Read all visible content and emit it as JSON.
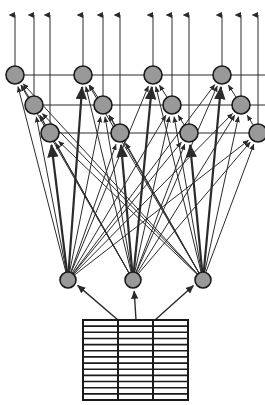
{
  "diagram": {
    "type": "neural-network-architecture",
    "canvas": {
      "width": 265,
      "height": 405
    },
    "colors": {
      "background": "#ffffff",
      "node_fill": "#999999",
      "node_stroke": "#1a1a1a",
      "edge": "#2b2b2b",
      "grid_line": "#1a1a1a",
      "grid_fill": "#ffffff"
    },
    "geometry": {
      "node_radius": 9,
      "hidden_node_radius": 8,
      "edge_width": 1,
      "thick_edge_width": 2.2,
      "grid_border_width": 2,
      "grid_row_line_width": 1.6,
      "grid_col_line_width": 2
    },
    "output_arrows": {
      "label": "output-arrows",
      "count": 12,
      "tip_y": 8,
      "x_positions": [
        15,
        34,
        50,
        83,
        103,
        120,
        153,
        172,
        189,
        222,
        241,
        258
      ]
    },
    "upper_layer": {
      "label": "upper-node-layer",
      "cluster_count": 4,
      "nodes_per_cluster": 3,
      "row_y": [
        75,
        105,
        133
      ],
      "clusters": [
        {
          "name": "cluster-1",
          "x": [
            15,
            34,
            50
          ]
        },
        {
          "name": "cluster-2",
          "x": [
            83,
            103,
            120
          ]
        },
        {
          "name": "cluster-3",
          "x": [
            153,
            172,
            189
          ]
        },
        {
          "name": "cluster-4",
          "x": [
            222,
            241,
            258
          ]
        }
      ],
      "horizontal_rails": [
        {
          "name": "rail-row-1",
          "y": 75,
          "x1": 15,
          "x2": 265
        },
        {
          "name": "rail-row-2",
          "y": 105,
          "x1": 34,
          "x2": 265
        },
        {
          "name": "rail-row-3",
          "y": 133,
          "x1": 50,
          "x2": 265
        }
      ]
    },
    "hidden_layer": {
      "label": "hidden-node-layer",
      "count": 3,
      "y": 280,
      "x_positions": [
        68,
        133,
        203
      ]
    },
    "data_grid": {
      "label": "input-data-table",
      "x": 83,
      "y": 320,
      "width": 105,
      "height": 80,
      "columns": 3,
      "rows": 13
    },
    "grid_to_hidden": {
      "label": "table-to-hidden-arrows",
      "count": 3,
      "sources": [
        118,
        136,
        155
      ],
      "targets": [
        68,
        133,
        203
      ]
    }
  }
}
